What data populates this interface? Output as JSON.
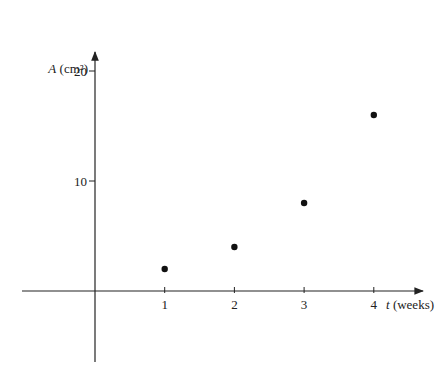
{
  "chart_data": {
    "type": "scatter",
    "title": "",
    "xlabel": "t (weeks)",
    "xlabel_var": "t",
    "xlabel_unit": "(weeks)",
    "ylabel": "A (cm²)",
    "ylabel_var": "A",
    "ylabel_unit": "(cm²)",
    "x_ticks": [
      1,
      2,
      3,
      4
    ],
    "y_ticks": [
      10,
      20
    ],
    "xlim": [
      -1.0,
      4.7
    ],
    "ylim": [
      -6.5,
      20
    ],
    "grid": false,
    "legend": null,
    "series": [
      {
        "name": "A vs t",
        "x": [
          1,
          2,
          3,
          4
        ],
        "y": [
          2,
          4,
          8,
          16
        ]
      }
    ]
  },
  "colors": {
    "axis": "#222222",
    "point": "#111111",
    "background": "#ffffff"
  }
}
